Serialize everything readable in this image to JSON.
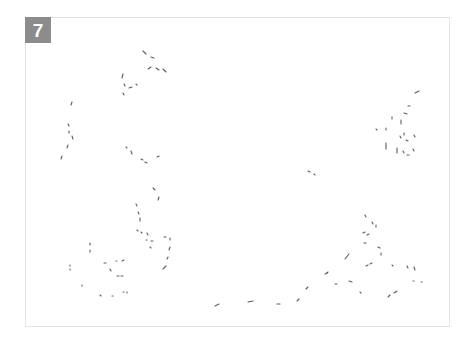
{
  "figure": {
    "panel_label": "7",
    "badge_color": "#8c8c8c",
    "border_color": "#e4e4e4",
    "stroke_color": "#333333"
  },
  "strokes": [
    [
      143,
      51,
      146,
      54
    ],
    [
      151,
      57,
      154,
      58
    ],
    [
      148,
      69,
      151,
      67
    ],
    [
      156,
      68,
      159,
      70
    ],
    [
      163,
      69,
      166,
      72
    ],
    [
      123,
      74,
      122,
      78
    ],
    [
      124,
      84,
      125,
      86
    ],
    [
      129,
      88,
      132,
      87
    ],
    [
      136,
      84,
      137,
      85
    ],
    [
      123,
      93,
      124,
      95
    ],
    [
      72,
      102,
      71,
      105
    ],
    [
      68,
      124,
      69,
      126
    ],
    [
      69,
      131,
      69,
      133
    ],
    [
      72,
      136,
      73,
      139
    ],
    [
      68,
      145,
      67,
      148
    ],
    [
      62,
      156,
      61,
      159
    ],
    [
      126,
      147,
      127,
      148
    ],
    [
      131,
      151,
      132,
      154
    ],
    [
      141,
      159,
      143,
      160
    ],
    [
      145,
      162,
      147,
      163
    ],
    [
      157,
      157,
      159,
      156
    ],
    [
      153,
      188,
      155,
      190
    ],
    [
      159,
      197,
      158,
      200
    ],
    [
      136,
      204,
      137,
      206
    ],
    [
      138,
      212,
      139,
      214
    ],
    [
      140,
      218,
      140,
      221
    ],
    [
      137,
      230,
      138,
      231
    ],
    [
      141,
      232,
      142,
      233
    ],
    [
      147,
      233,
      148,
      235
    ],
    [
      146,
      240,
      147,
      240
    ],
    [
      151,
      241,
      153,
      241
    ],
    [
      150,
      247,
      151,
      248
    ],
    [
      164,
      237,
      166,
      237
    ],
    [
      170,
      238,
      170,
      240
    ],
    [
      170,
      247,
      169,
      250
    ],
    [
      168,
      257,
      167,
      259
    ],
    [
      166,
      266,
      163,
      269
    ],
    [
      90,
      243,
      90,
      245
    ],
    [
      90,
      250,
      90,
      252
    ],
    [
      104,
      263,
      106,
      263
    ],
    [
      116,
      261,
      117,
      261
    ],
    [
      122,
      261,
      124,
      260
    ],
    [
      70,
      265,
      70,
      266
    ],
    [
      70,
      269,
      70,
      270
    ],
    [
      110,
      269,
      111,
      271
    ],
    [
      117,
      276,
      119,
      276
    ],
    [
      121,
      276,
      123,
      276
    ],
    [
      82,
      285,
      82,
      286
    ],
    [
      100,
      295,
      101,
      296
    ],
    [
      112,
      296,
      113,
      296
    ],
    [
      123,
      292,
      124,
      292
    ],
    [
      127,
      292,
      127,
      293
    ],
    [
      215,
      306,
      219,
      304
    ],
    [
      248,
      302,
      253,
      301
    ],
    [
      277,
      304,
      280,
      304
    ],
    [
      297,
      301,
      299,
      299
    ],
    [
      306,
      289,
      308,
      287
    ],
    [
      325,
      274,
      327,
      273
    ],
    [
      415,
      93,
      419,
      91
    ],
    [
      408,
      106,
      410,
      106
    ],
    [
      404,
      113,
      407,
      114
    ],
    [
      392,
      117,
      392,
      119
    ],
    [
      401,
      120,
      401,
      124
    ],
    [
      386,
      128,
      386,
      130
    ],
    [
      404,
      133,
      404,
      135
    ],
    [
      400,
      136,
      401,
      138
    ],
    [
      406,
      140,
      408,
      141
    ],
    [
      414,
      135,
      415,
      137
    ],
    [
      386,
      143,
      386,
      149
    ],
    [
      397,
      148,
      397,
      153
    ],
    [
      403,
      151,
      404,
      153
    ],
    [
      407,
      155,
      409,
      155
    ],
    [
      413,
      149,
      414,
      151
    ],
    [
      376,
      129,
      377,
      130
    ],
    [
      308,
      171,
      310,
      172
    ],
    [
      314,
      174,
      315,
      175
    ],
    [
      365,
      215,
      366,
      217
    ],
    [
      372,
      222,
      373,
      224
    ],
    [
      376,
      225,
      376,
      227
    ],
    [
      363,
      233,
      365,
      232
    ],
    [
      367,
      235,
      369,
      234
    ],
    [
      364,
      243,
      366,
      243
    ],
    [
      378,
      247,
      380,
      248
    ],
    [
      381,
      253,
      381,
      255
    ],
    [
      345,
      259,
      349,
      254
    ],
    [
      366,
      266,
      368,
      265
    ],
    [
      370,
      264,
      372,
      263
    ],
    [
      392,
      265,
      393,
      266
    ],
    [
      407,
      266,
      408,
      268
    ],
    [
      414,
      267,
      415,
      270
    ],
    [
      327,
      273,
      328,
      272
    ],
    [
      335,
      284,
      337,
      284
    ],
    [
      349,
      281,
      352,
      282
    ],
    [
      360,
      292,
      361,
      293
    ],
    [
      388,
      297,
      390,
      295
    ],
    [
      394,
      293,
      397,
      291
    ],
    [
      413,
      281,
      414,
      281
    ],
    [
      421,
      282,
      422,
      282
    ]
  ]
}
